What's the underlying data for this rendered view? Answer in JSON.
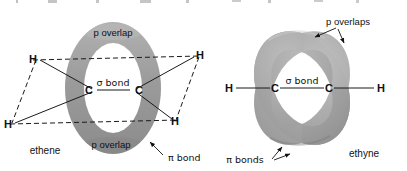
{
  "figure": {
    "background_color": "#ffffff",
    "orbital_color": "#9a9a9a",
    "orbital_color_dark": "#8a8a8a",
    "orbital_highlight": "#bdbdbd",
    "line_color": "#1a1a1a",
    "text_color": "#111111"
  },
  "ethene": {
    "name_label": "ethene",
    "p_overlap_top_label": "p overlap",
    "p_overlap_bottom_label": "p overlap",
    "sigma_bond_label": "σ bond",
    "pi_bond_label": "π bond",
    "atoms": {
      "carbon_left": "C",
      "carbon_right": "C",
      "hydrogen_top_left": "H",
      "hydrogen_bottom_left": "H",
      "hydrogen_top_right": "H",
      "hydrogen_bottom_right": "H"
    }
  },
  "ethyne": {
    "name_label": "ethyne",
    "p_overlaps_label": "p overlaps",
    "sigma_bond_label": "σ bond",
    "pi_bonds_label": "π bonds",
    "atoms": {
      "carbon_left": "C",
      "carbon_right": "C",
      "hydrogen_left": "H",
      "hydrogen_right": "H"
    }
  }
}
